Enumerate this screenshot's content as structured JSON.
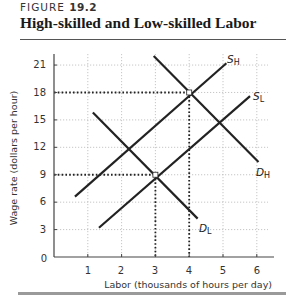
{
  "figure": {
    "label_prefix": "FIGURE",
    "number": "19.2",
    "title": "High-skilled and Low-skilled Labor"
  },
  "chart_data": {
    "type": "line",
    "title": "High-skilled and Low-skilled Labor",
    "xlabel": "Labor (thousands of hours per day)",
    "ylabel": "Wage rate (dollars per hour)",
    "xlim": [
      0,
      6.5
    ],
    "ylim": [
      0,
      22
    ],
    "xticks": [
      0,
      1,
      2,
      3,
      4,
      5,
      6
    ],
    "yticks": [
      3,
      6,
      9,
      12,
      15,
      18,
      21
    ],
    "origin_label": "0",
    "grid": true,
    "legend": "none (curves labeled directly)",
    "series": [
      {
        "name": "S_H",
        "label": "S",
        "subscript": "H",
        "kind": "supply",
        "points": [
          [
            0.62,
            6.6
          ],
          [
            5.1,
            21.2
          ]
        ]
      },
      {
        "name": "D_H",
        "label": "D",
        "subscript": "H",
        "kind": "demand",
        "points": [
          [
            2.95,
            22.0
          ],
          [
            6.05,
            10.4
          ]
        ]
      },
      {
        "name": "S_L",
        "label": "S",
        "subscript": "L",
        "kind": "supply",
        "points": [
          [
            1.33,
            3.2
          ],
          [
            5.8,
            17.6
          ]
        ]
      },
      {
        "name": "D_L",
        "label": "D",
        "subscript": "L",
        "kind": "demand",
        "points": [
          [
            1.15,
            15.8
          ],
          [
            4.25,
            4.2
          ]
        ]
      }
    ],
    "equilibria": [
      {
        "market": "high-skilled",
        "labor": 4,
        "wage": 18
      },
      {
        "market": "low-skilled",
        "labor": 3,
        "wage": 9
      }
    ],
    "annotations": [
      {
        "type": "dotted-guide",
        "from": [
          0,
          18
        ],
        "to": [
          4,
          18
        ]
      },
      {
        "type": "dotted-guide",
        "from": [
          4,
          18
        ],
        "to": [
          4,
          0
        ]
      },
      {
        "type": "dotted-guide",
        "from": [
          0,
          9
        ],
        "to": [
          3,
          9
        ]
      },
      {
        "type": "dotted-guide",
        "from": [
          3,
          9
        ],
        "to": [
          3,
          0
        ]
      }
    ]
  },
  "axes": {
    "xlabel": "Labor (thousands of hours per day)",
    "ylabel": "Wage rate (dollars per hour)",
    "origin": "0",
    "xticks": [
      "1",
      "2",
      "3",
      "4",
      "5",
      "6"
    ],
    "yticks": [
      "3",
      "6",
      "9",
      "12",
      "15",
      "18",
      "21"
    ]
  },
  "labels": {
    "SH": {
      "main": "S",
      "sub": "H"
    },
    "DH": {
      "main": "D",
      "sub": "H"
    },
    "SL": {
      "main": "S",
      "sub": "L"
    },
    "DL": {
      "main": "D",
      "sub": "L"
    }
  },
  "colors": {
    "curve": "#222222",
    "grid": "#b8b8b8",
    "axis": "#444444",
    "rule_bottom": "#9a9a9a"
  }
}
